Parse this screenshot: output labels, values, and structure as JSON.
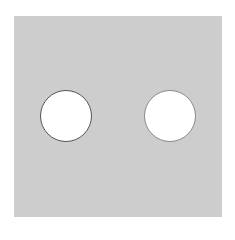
{
  "panel": {
    "color": "#cdcdcd",
    "x": 14,
    "y": 16,
    "width": 208,
    "height": 201
  },
  "holes": [
    {
      "name": "left-hole",
      "cx": 66,
      "cy": 116,
      "r": 26,
      "fill": "#ffffff",
      "border": "#555555"
    },
    {
      "name": "right-hole",
      "cx": 170,
      "cy": 116,
      "r": 26,
      "fill": "#ffffff",
      "border": "#8a8a8a"
    }
  ]
}
